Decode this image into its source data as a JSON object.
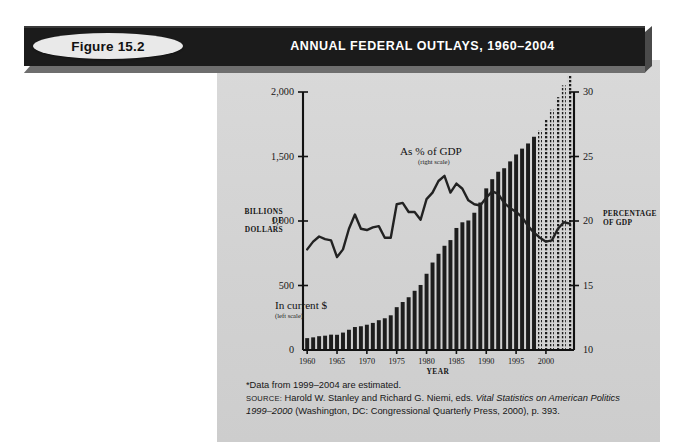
{
  "banner": {
    "figure_badge": "Figure 15.2",
    "title": "ANNUAL FEDERAL OUTLAYS, 1960–2004",
    "bar_color": "#1b1b1b",
    "badge_color": "#e9e9e9"
  },
  "panel": {
    "background": "#d4d4d4"
  },
  "footnote": {
    "line1": "*Data from 1999–2004 are estimated.",
    "source_label": "SOURCE:",
    "line2_a": " Harold W. Stanley and Richard G. Niemi, eds. ",
    "line2_italic": "Vital Statistics on American Politics",
    "line3_italic": "1999–2000",
    "line3_b": " (Washington, DC: Congressional Quarterly Press, 2000), p. 393."
  },
  "chart_data": {
    "type": "bar",
    "title": "ANNUAL FEDERAL OUTLAYS, 1960–2004",
    "xlabel": "YEAR",
    "ylabel": "BILLIONS OF DOLLARS",
    "y2label": "PERCENTAGE OF GDP",
    "ylabel_lines": [
      "BILLIONS",
      "OF",
      "DOLLARS"
    ],
    "y2label_lines": [
      "PERCENTAGE",
      "OF GDP"
    ],
    "grid": false,
    "legend_position": "inline-annotations",
    "annotations": [
      {
        "text": "As % of GDP",
        "sub": "(right scale)",
        "series": "pct_gdp"
      },
      {
        "text": "In current $",
        "sub": "(left scale)",
        "series": "outlays"
      }
    ],
    "xlim": [
      1959.3,
      2004.7
    ],
    "xticks": [
      1960,
      1965,
      1970,
      1975,
      1980,
      1985,
      1990,
      1995,
      2000
    ],
    "ylim": [
      0,
      2000
    ],
    "yticks": [
      0,
      500,
      1000,
      1500,
      2000
    ],
    "ytick_labels": [
      "0",
      "500",
      "1,000",
      "1,500",
      "2,000"
    ],
    "y2lim": [
      10,
      30
    ],
    "y2ticks": [
      10,
      15,
      20,
      25,
      30
    ],
    "y2tick_labels": [
      "10",
      "15",
      "20",
      "25",
      "30"
    ],
    "estimated_from": 1999,
    "estimated_note": "Bars for 1999–2004 are drawn with a dotted pattern (estimated).",
    "x": [
      1960,
      1961,
      1962,
      1963,
      1964,
      1965,
      1966,
      1967,
      1968,
      1969,
      1970,
      1971,
      1972,
      1973,
      1974,
      1975,
      1976,
      1977,
      1978,
      1979,
      1980,
      1981,
      1982,
      1983,
      1984,
      1985,
      1986,
      1987,
      1988,
      1989,
      1990,
      1991,
      1992,
      1993,
      1994,
      1995,
      1996,
      1997,
      1998,
      1999,
      2000,
      2001,
      2002,
      2003,
      2004
    ],
    "series": [
      {
        "name": "In current $",
        "axis": "left",
        "unit": "billions of dollars",
        "type": "bar",
        "values": [
          92,
          98,
          107,
          111,
          119,
          118,
          135,
          157,
          178,
          184,
          196,
          210,
          231,
          246,
          269,
          332,
          372,
          409,
          459,
          504,
          591,
          678,
          746,
          808,
          852,
          946,
          990,
          1004,
          1064,
          1143,
          1253,
          1324,
          1382,
          1409,
          1462,
          1516,
          1561,
          1601,
          1653,
          1703,
          1789,
          1863,
          1960,
          2052,
          2128
        ]
      },
      {
        "name": "As % of GDP",
        "axis": "right",
        "unit": "percent of GDP",
        "type": "line",
        "values": [
          17.8,
          18.4,
          18.8,
          18.6,
          18.5,
          17.2,
          17.8,
          19.4,
          20.5,
          19.4,
          19.3,
          19.5,
          19.6,
          18.7,
          18.7,
          21.3,
          21.4,
          20.7,
          20.7,
          20.1,
          21.7,
          22.2,
          23.1,
          23.5,
          22.2,
          22.9,
          22.5,
          21.6,
          21.3,
          21.2,
          21.8,
          22.3,
          22.1,
          21.4,
          21.0,
          20.7,
          20.3,
          19.6,
          19.1,
          18.7,
          18.4,
          18.5,
          19.4,
          19.9,
          19.8
        ]
      }
    ]
  }
}
